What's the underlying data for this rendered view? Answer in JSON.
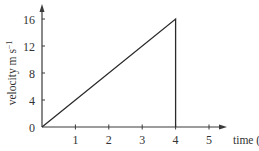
{
  "chart_data": {
    "type": "line",
    "title": "",
    "xlabel": "time (s)",
    "ylabel": "velocity m s⁻¹",
    "ylabel_main": "velocity m s",
    "ylabel_sup": "−1",
    "x_ticks": [
      "1",
      "2",
      "3",
      "4",
      "5"
    ],
    "y_ticks": [
      "0",
      "4",
      "8",
      "12",
      "16"
    ],
    "origin_label": "0",
    "xlim": [
      0,
      5.5
    ],
    "ylim": [
      0,
      18
    ],
    "grid": false,
    "legend": null,
    "series": [
      {
        "name": "velocity",
        "x": [
          0,
          4,
          4
        ],
        "y": [
          0,
          16,
          0
        ]
      }
    ]
  },
  "colors": {
    "line": "#2a2a2a",
    "axis": "#3a3a3a",
    "text": "#333333",
    "background": "#ffffff"
  }
}
